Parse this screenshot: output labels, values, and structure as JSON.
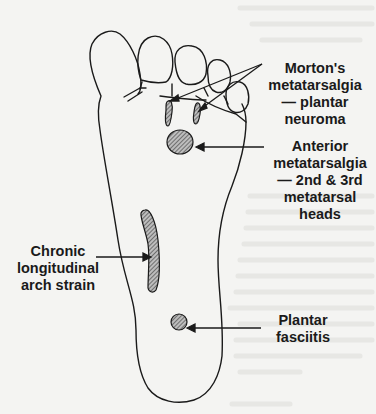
{
  "diagram": {
    "colors": {
      "background": "#f4f4f2",
      "ink": "#1a1a1a"
    },
    "labels": [
      {
        "id": "morton",
        "lines": [
          "Morton's",
          "metatarsalgia",
          "— plantar",
          "neuroma"
        ]
      },
      {
        "id": "anterior",
        "lines": [
          "Anterior",
          "metatarsalgia",
          "— 2nd & 3rd",
          "metatarsal",
          "heads"
        ]
      },
      {
        "id": "chronic",
        "lines": [
          "Chronic",
          "longitudinal",
          "arch strain"
        ]
      },
      {
        "id": "plantar",
        "lines": [
          "Plantar",
          "fasciitis"
        ]
      }
    ]
  }
}
